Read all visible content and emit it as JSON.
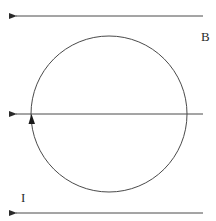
{
  "diagram": {
    "type": "physics-field-loop",
    "labels": {
      "field": "B",
      "current": "I"
    },
    "field_lines": [
      {
        "id": "top",
        "y": 16,
        "x_start": 203,
        "x_end": 14,
        "direction": "left"
      },
      {
        "id": "middle",
        "y": 114,
        "x_start": 203,
        "x_end": 14,
        "direction": "left"
      },
      {
        "id": "bottom",
        "y": 213,
        "x_start": 203,
        "x_end": 14,
        "direction": "left"
      }
    ],
    "loop": {
      "shape": "circle",
      "cx": 109,
      "cy": 114,
      "r": 79,
      "current_arrow": {
        "x": 32,
        "y": 120,
        "direction": "up"
      }
    },
    "colors": {
      "line": "#4a4a4a",
      "arrow": "#1a1a1a",
      "background": "#ffffff"
    }
  }
}
